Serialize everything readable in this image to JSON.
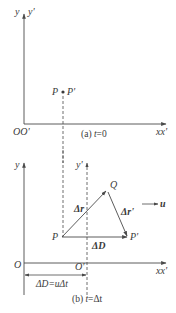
{
  "panel_a": {
    "caption": "(a) t=0",
    "caption_prefix": "(a) ",
    "caption_var": "t",
    "caption_suffix": "=0",
    "y_axis_label": "y",
    "y_prime_axis_label": "y'",
    "origin_label": "OO'",
    "x_axis_label": "xx'",
    "point_label_left": "P",
    "point_label_right": "P'"
  },
  "panel_b": {
    "caption_prefix": "(b) ",
    "caption_var": "t",
    "caption_suffix": "=Δt",
    "y_axis_label": "y",
    "y_prime_axis_label": "y'",
    "origin_label": "O",
    "origin_prime_label": "O'",
    "x_axis_label": "xx'",
    "point_p": "P",
    "point_p_prime": "P'",
    "point_q": "Q",
    "vector_dr": "Δr",
    "vector_dr_prime": "Δr'",
    "vector_dD": "ΔD",
    "velocity_label": "u",
    "displacement_label": "ΔD=uΔt"
  },
  "colors": {
    "line": "#4a4a4a",
    "text": "#3a3a3a",
    "background": "#ffffff"
  }
}
